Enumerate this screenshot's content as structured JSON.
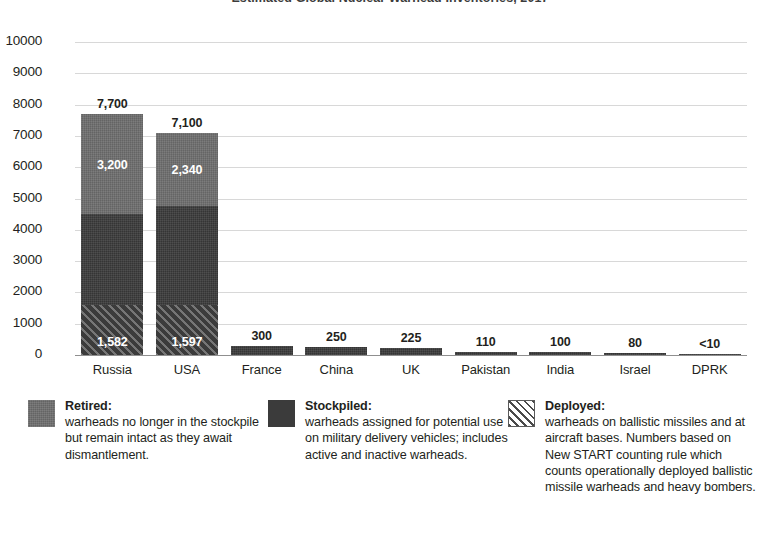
{
  "chart_data": {
    "type": "bar",
    "subtype": "stacked-bar",
    "title": "Estimated Global Nuclear Warhead Inventories, 2017",
    "categories": [
      "Russia",
      "USA",
      "France",
      "China",
      "UK",
      "Pakistan",
      "India",
      "Israel",
      "DPRK"
    ],
    "series": [
      {
        "name": "Deployed",
        "values": [
          1582,
          1597,
          0,
          0,
          0,
          0,
          0,
          0,
          0
        ],
        "pattern": "diagonal-hatch",
        "color": "#3b3b3b"
      },
      {
        "name": "Stockpiled",
        "values": [
          2918,
          3163,
          300,
          250,
          225,
          110,
          100,
          80,
          10
        ],
        "pattern": "solid",
        "color": "#3b3b3b"
      },
      {
        "name": "Retired",
        "values": [
          3200,
          2340,
          0,
          0,
          0,
          0,
          0,
          0,
          0
        ],
        "pattern": "solid",
        "color": "#6f6f6f"
      }
    ],
    "totals": [
      7700,
      7100,
      300,
      250,
      225,
      110,
      100,
      80,
      10
    ],
    "total_labels": [
      "7,700",
      "7,100",
      "300",
      "250",
      "225",
      "110",
      "100",
      "80",
      "<10"
    ],
    "retired_labels": [
      "3,200",
      "2,340",
      "",
      "",
      "",
      "",
      "",
      "",
      ""
    ],
    "deployed_labels": [
      "1,582",
      "1,597",
      "",
      "",
      "",
      "",
      "",
      "",
      ""
    ],
    "xlabel": "",
    "ylabel": "",
    "ylim": [
      0,
      10000
    ],
    "ytick_values": [
      10000,
      9000,
      8000,
      7000,
      6000,
      5000,
      4000,
      3000,
      2000,
      1000,
      0
    ],
    "ytick_labels": [
      "10000",
      "9000",
      "8000",
      "7000",
      "6000",
      "5000",
      "4000",
      "3000",
      "2000",
      "1000",
      "0"
    ],
    "grid": true,
    "grid_axis": "y",
    "legend_position": "bottom"
  },
  "legend": {
    "items": [
      {
        "swatch": "retired-swatch",
        "term": "Retired:",
        "description": "warheads no longer in the stockpile but remain intact as they await dismantlement."
      },
      {
        "swatch": "stockpiled-swatch",
        "term": "Stockpiled:",
        "description": "warheads assigned for potential use on military delivery vehicles; includes active and inactive warheads."
      },
      {
        "swatch": "deployed-swatch",
        "term": "Deployed:",
        "description": "warheads on ballistic missiles and at aircraft bases. Numbers based on New START counting rule which counts operationally deployed ballistic missile warheads and heavy bombers."
      }
    ]
  },
  "colors": {
    "retired": "#6f6f6f",
    "stockpiled": "#3b3b3b",
    "deployed": "#3b3b3b",
    "gridline": "#d8d8d8",
    "axis": "#8f8f8f",
    "text": "#231f20"
  }
}
